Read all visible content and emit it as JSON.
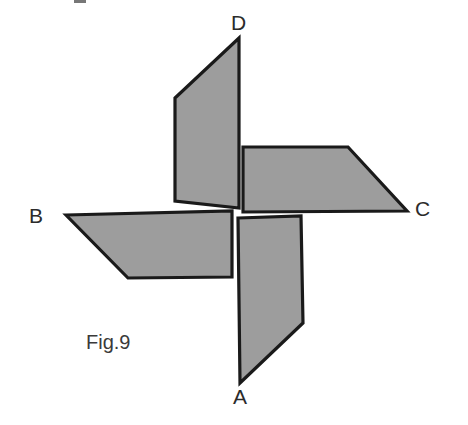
{
  "figure": {
    "caption": "Fig.9",
    "caption_position": {
      "x": 86,
      "y": 332
    },
    "background_color": "#ffffff",
    "fill_color": "#9d9d9d",
    "stroke_color": "#1a1a1a",
    "stroke_width": 3.2
  },
  "labels": [
    {
      "id": "label-a",
      "text": "A",
      "x": 233,
      "y": 386
    },
    {
      "id": "label-b",
      "text": "B",
      "x": 29,
      "y": 205
    },
    {
      "id": "label-c",
      "text": "C",
      "x": 415,
      "y": 198
    },
    {
      "id": "label-d",
      "text": "D",
      "x": 231,
      "y": 12
    }
  ],
  "blades": [
    {
      "id": "blade-d",
      "label": "D",
      "points": "239,38 239,208 175,201 175,98",
      "note": "upper blade, apex at D"
    },
    {
      "id": "blade-c",
      "label": "C",
      "points": "243,147 348,147 407,211 243,212",
      "note": "right blade, tip at C"
    },
    {
      "id": "blade-b",
      "label": "B",
      "points": "66,215 232,211 232,277 128,278",
      "note": "left blade, tip at B"
    },
    {
      "id": "blade-a",
      "label": "A",
      "points": "238,218 301,216 303,323 240,383",
      "note": "lower blade, tip at A"
    }
  ],
  "artifact": {
    "id": "scan-artifact",
    "x": 74,
    "y": 0,
    "width": 12,
    "height": 3
  }
}
